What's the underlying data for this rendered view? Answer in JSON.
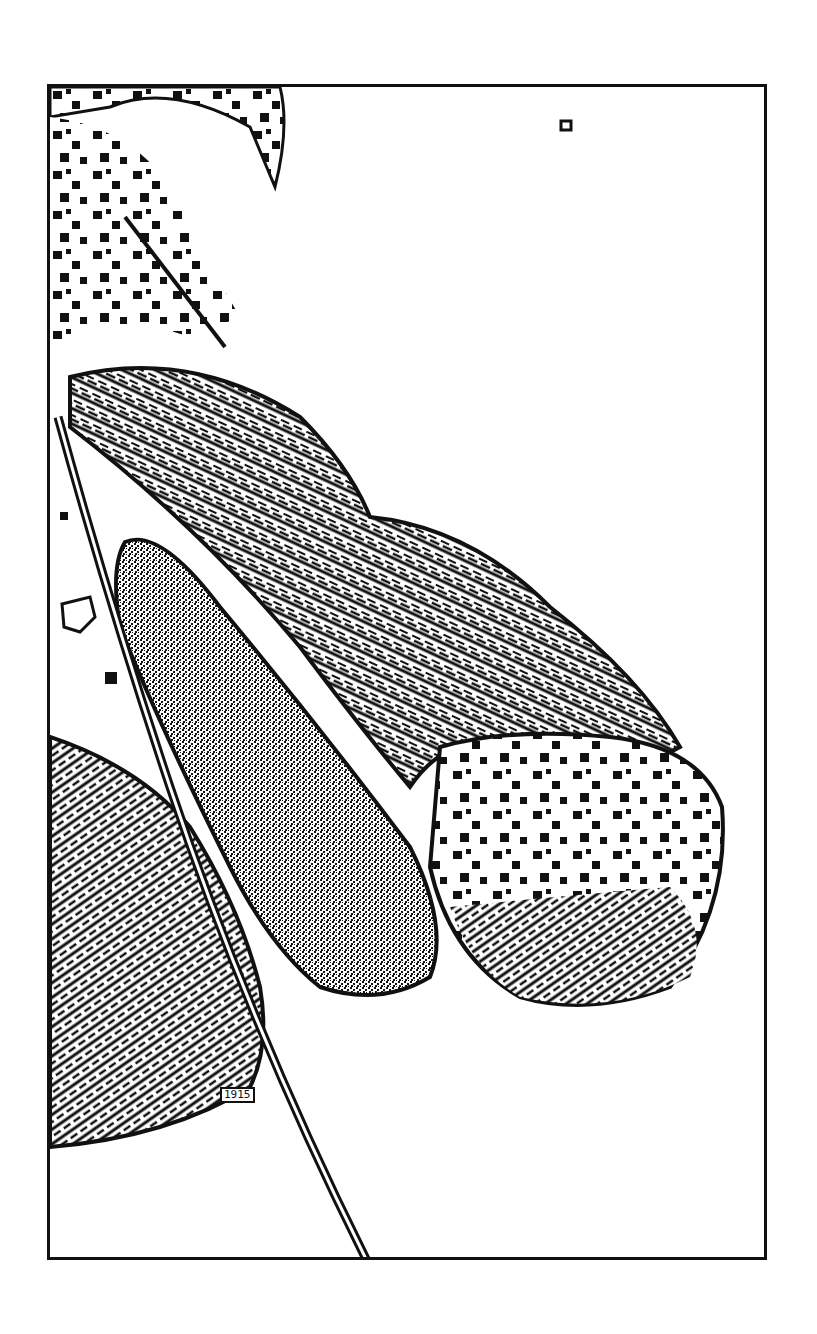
{
  "image": {
    "description": "Edge-detected black-and-white line art of plant leaves within a rectangular frame",
    "frame": {
      "x": 47,
      "y": 84,
      "width": 720,
      "height": 1176,
      "stroke": "#111111"
    },
    "colors": {
      "ink": "#111111",
      "paper": "#ffffff"
    },
    "marks": {
      "small_stamp": "1915"
    },
    "subjects": [
      "upper-left leaf cluster with scattered square speckles",
      "large central leaf with hatched texture pointing right",
      "narrow stippled leaf overlapping central leaf",
      "lower-left dense hatched leaf",
      "thin diagonal stem running to bottom of frame"
    ]
  }
}
